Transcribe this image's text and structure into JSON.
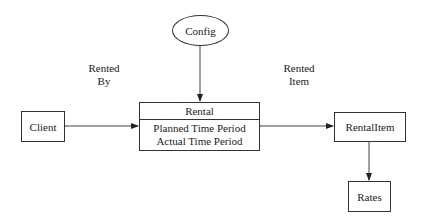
{
  "diagram": {
    "nodes": {
      "config": {
        "label": "Config",
        "shape": "ellipse"
      },
      "rental": {
        "label": "Rental",
        "shape": "class",
        "attributes": [
          "Planned Time Period",
          "Actual Time Period"
        ]
      },
      "client": {
        "label": "Client",
        "shape": "box"
      },
      "rental_item": {
        "label": "RentalItem",
        "shape": "box"
      },
      "rates": {
        "label": "Rates",
        "shape": "box"
      }
    },
    "edge_labels": {
      "rented_by": [
        "Rented",
        "By"
      ],
      "rented_item": [
        "Rented",
        "Item"
      ]
    },
    "edges": [
      {
        "from": "Config",
        "to": "Rental",
        "type": "directed"
      },
      {
        "from": "Client",
        "to": "Rental",
        "type": "bidirectional",
        "label": "Rented By"
      },
      {
        "from": "Rental",
        "to": "RentalItem",
        "type": "bidirectional",
        "label": "Rented Item"
      },
      {
        "from": "RentalItem",
        "to": "Rates",
        "type": "directed"
      }
    ]
  }
}
